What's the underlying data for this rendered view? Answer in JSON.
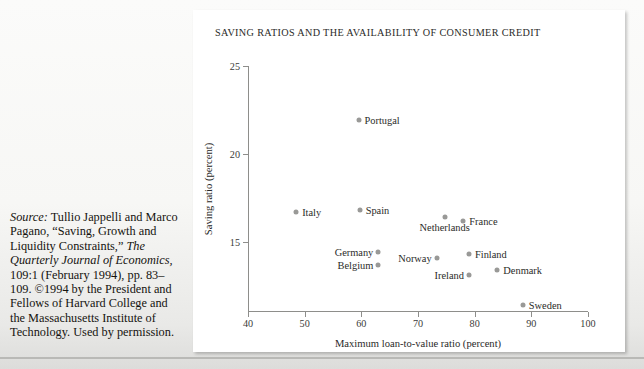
{
  "source_caption": {
    "lead": "Source:",
    "text_1": " Tullio Jappelli and Marco Pagano, “Saving, Growth and Liquidity Constraints,” ",
    "journal": "The Quarterly Journal of Economics,",
    "text_2": " 109:1 (February 1994), pp. 83–109. ©1994 by the President and Fellows of Harvard College and the Massachusetts Institute of Technology. Used by permission."
  },
  "figure": {
    "title": "SAVING RATIOS AND THE AVAILABILITY OF CONSUMER CREDIT"
  },
  "chart_data": {
    "type": "scatter",
    "title": "SAVING RATIOS AND THE AVAILABILITY OF CONSUMER CREDIT",
    "xlabel": "Maximum loan-to-value ratio (percent)",
    "ylabel": "Saving ratio (percent)",
    "xlim": [
      40,
      100
    ],
    "ylim": [
      11,
      25
    ],
    "xticks": [
      40,
      50,
      60,
      70,
      80,
      90,
      100
    ],
    "yticks": [
      15,
      20,
      25
    ],
    "grid": false,
    "legend": "none",
    "marker_color": "#999997",
    "points": [
      {
        "label": "Portugal",
        "x": 59.5,
        "y": 21.9,
        "label_pos": "right"
      },
      {
        "label": "Italy",
        "x": 48.5,
        "y": 16.7,
        "label_pos": "right"
      },
      {
        "label": "Spain",
        "x": 59.7,
        "y": 16.8,
        "label_pos": "right"
      },
      {
        "label": "Netherlands",
        "x": 74.7,
        "y": 16.4,
        "label_pos": "below"
      },
      {
        "label": "France",
        "x": 78.0,
        "y": 16.2,
        "label_pos": "right"
      },
      {
        "label": "Germany",
        "x": 63.0,
        "y": 14.4,
        "label_pos": "left"
      },
      {
        "label": "Belgium",
        "x": 63.0,
        "y": 13.7,
        "label_pos": "left"
      },
      {
        "label": "Norway",
        "x": 73.3,
        "y": 14.1,
        "label_pos": "left"
      },
      {
        "label": "Finland",
        "x": 79.0,
        "y": 14.3,
        "label_pos": "right"
      },
      {
        "label": "Ireland",
        "x": 79.0,
        "y": 13.1,
        "label_pos": "left"
      },
      {
        "label": "Denmark",
        "x": 84.0,
        "y": 13.4,
        "label_pos": "right"
      },
      {
        "label": "Sweden",
        "x": 88.5,
        "y": 11.4,
        "label_pos": "right"
      }
    ]
  }
}
